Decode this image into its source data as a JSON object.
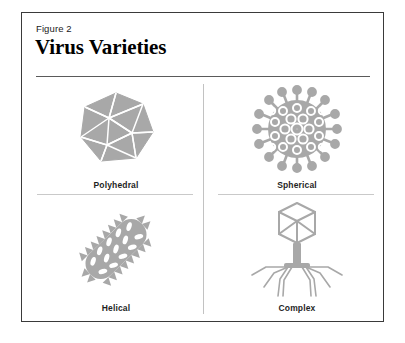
{
  "figure": {
    "number": "Figure 2",
    "title": "Virus Varieties"
  },
  "colors": {
    "border": "#3a3a3a",
    "title_rule": "#5a5a5a",
    "divider": "#c2c2c2",
    "label_rule": "#c9c9c9",
    "virus_gray": "#a8a8a8",
    "virus_gray_dark": "#9a9a9a",
    "facet_line": "#ffffff",
    "background": "#ffffff",
    "text": "#1a1a1a"
  },
  "quadrants": [
    {
      "id": "polyhedral",
      "label": "Polyhedral",
      "icon": "icosahedron-virus-icon",
      "position": "top-left",
      "has_rule": true
    },
    {
      "id": "spherical",
      "label": "Spherical",
      "icon": "spherical-virus-icon",
      "position": "top-right",
      "has_rule": true
    },
    {
      "id": "helical",
      "label": "Helical",
      "icon": "helical-virus-icon",
      "position": "bottom-left",
      "has_rule": false
    },
    {
      "id": "complex",
      "label": "Complex",
      "icon": "complex-bacteriophage-icon",
      "position": "bottom-right",
      "has_rule": false
    }
  ]
}
